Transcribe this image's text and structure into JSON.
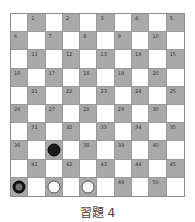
{
  "board": {
    "size": 10,
    "colors": {
      "dark": "#a9a9a9",
      "light": "#ffffff",
      "grid": "#9a9a9a"
    },
    "numbering": "dark squares numbered 1-50, row-major from top-left",
    "pieces": [
      {
        "square": 37,
        "type": "black"
      },
      {
        "square": 46,
        "type": "black-king"
      },
      {
        "square": 47,
        "type": "white"
      },
      {
        "square": 48,
        "type": "white"
      }
    ]
  },
  "caption": "習題 4"
}
